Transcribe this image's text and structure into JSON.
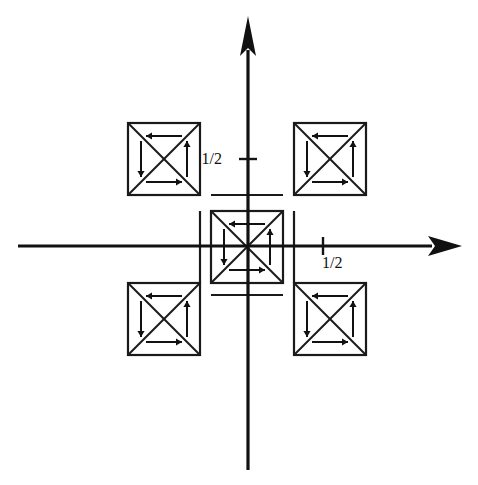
{
  "figure": {
    "background_color": "#ffffff",
    "line_color": "#1a1a1a",
    "width": 478,
    "height": 485
  },
  "axes": {
    "origin": {
      "x": 248,
      "y": 246
    },
    "x_axis": {
      "name": "horizontal-axis",
      "start_x": 18,
      "end_x": 462,
      "y": 246,
      "arrow_direction": "right"
    },
    "y_axis": {
      "name": "vertical-axis",
      "x": 248,
      "start_y": 470,
      "end_y": 16,
      "arrow_direction": "up"
    },
    "ticks": [
      {
        "axis": "y",
        "label": "1/2",
        "value": 0.5,
        "position": {
          "x": 248,
          "y": 159
        },
        "label_position": {
          "x": 222,
          "y": 164
        },
        "label_anchor": "end"
      },
      {
        "axis": "x",
        "label": "1/2",
        "value": 0.5,
        "position": {
          "x": 323,
          "y": 246
        },
        "label_position": {
          "x": 322,
          "y": 268
        },
        "label_anchor": "start"
      }
    ]
  },
  "cells": [
    {
      "name": "cell-top-left",
      "quadrant": "top-left",
      "x": 128,
      "y": 123,
      "size": 72,
      "arrows": {
        "top": "left",
        "bottom": "right",
        "left": "down",
        "right": "up"
      },
      "diagonals": "both"
    },
    {
      "name": "cell-top-right",
      "quadrant": "top-right",
      "x": 294,
      "y": 123,
      "size": 72,
      "arrows": {
        "top": "left",
        "bottom": "right",
        "left": "down",
        "right": "up"
      },
      "diagonals": "both"
    },
    {
      "name": "cell-center",
      "quadrant": "center",
      "x": 211,
      "y": 211,
      "size": 72,
      "arrows": {
        "top": "left",
        "bottom": "right",
        "left": "down",
        "right": "up"
      },
      "diagonals": "both"
    },
    {
      "name": "cell-bottom-left",
      "quadrant": "bottom-left",
      "x": 128,
      "y": 283,
      "size": 72,
      "arrows": {
        "top": "left",
        "bottom": "right",
        "left": "down",
        "right": "up"
      },
      "diagonals": "both"
    },
    {
      "name": "cell-bottom-right",
      "quadrant": "bottom-right",
      "x": 294,
      "y": 283,
      "size": 72,
      "arrows": {
        "top": "left",
        "bottom": "right",
        "left": "down",
        "right": "up"
      },
      "diagonals": "both"
    }
  ],
  "connectors": [
    {
      "name": "connector-top",
      "x1": 211,
      "y1": 195,
      "x2": 283,
      "y2": 195
    },
    {
      "name": "connector-bottom",
      "x1": 211,
      "y1": 295,
      "x2": 283,
      "y2": 295
    },
    {
      "name": "connector-left",
      "x1": 200,
      "y1": 211,
      "x2": 200,
      "y2": 283
    },
    {
      "name": "connector-right",
      "x1": 294,
      "y1": 211,
      "x2": 294,
      "y2": 283
    }
  ]
}
